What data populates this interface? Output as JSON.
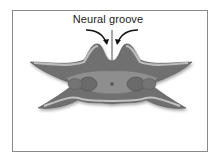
{
  "diagram": {
    "label": "Neural groove",
    "colors": {
      "frame_border": "#8a8a8a",
      "outer_tissue": "#6e6e6e",
      "outer_highlight": "#b8b8b8",
      "inner_tissue": "#8c8c8c",
      "somite": "#6a6a6a",
      "notochord": "#5a5a5a",
      "arrow": "#111111"
    }
  }
}
